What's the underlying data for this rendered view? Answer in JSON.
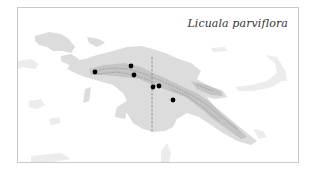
{
  "map": {
    "title": "Licuala parviflora",
    "region": "New Guinea",
    "colors": {
      "land": "#dcdcdc",
      "highlands": "#c4c4c4",
      "mountain_ridge": "#9a9a9a",
      "distant_land": "#ececec",
      "border_line": "#8a8a8a",
      "point": "#000000",
      "frame": "#c9c9c9"
    },
    "border": {
      "type": "dashed",
      "x": 151,
      "y1": 56,
      "y2": 131
    },
    "occurrence_points": [
      {
        "x": 94,
        "y": 71
      },
      {
        "x": 130,
        "y": 65
      },
      {
        "x": 133,
        "y": 74
      },
      {
        "x": 152,
        "y": 86
      },
      {
        "x": 158,
        "y": 85
      },
      {
        "x": 172,
        "y": 99
      }
    ]
  }
}
